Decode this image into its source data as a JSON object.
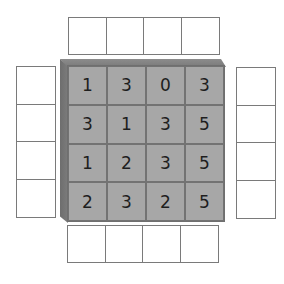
{
  "puzzle": {
    "type": "skyscraper-style clue grid",
    "size": 4,
    "grid": [
      [
        "1",
        "3",
        "0",
        "3"
      ],
      [
        "3",
        "1",
        "3",
        "5"
      ],
      [
        "1",
        "2",
        "3",
        "5"
      ],
      [
        "2",
        "3",
        "2",
        "5"
      ]
    ],
    "clues": {
      "top": [
        "",
        "",
        "",
        ""
      ],
      "bottom": [
        "",
        "",
        "",
        ""
      ],
      "left": [
        "",
        "",
        "",
        ""
      ],
      "right": [
        "",
        "",
        "",
        ""
      ]
    }
  },
  "colors": {
    "cell_face": "#a7a7a7",
    "bevel": "#7a7a7a",
    "clue_border": "#7a7a7a",
    "text": "#1e1e1e"
  }
}
